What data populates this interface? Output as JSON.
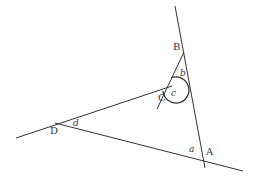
{
  "diagram": {
    "type": "geometry-quadrilateral-angles",
    "points": {
      "A": {
        "label": "A",
        "x": 203,
        "y": 158
      },
      "B": {
        "label": "B",
        "x": 182,
        "y": 45
      },
      "C": {
        "label": "C",
        "x": 172,
        "y": 86
      },
      "D": {
        "label": "D",
        "x": 55,
        "y": 123
      }
    },
    "angles": {
      "a": "a",
      "b": "b",
      "c": "c",
      "d": "d"
    },
    "colors": {
      "stroke": "#333333",
      "background": "#ffffff"
    }
  }
}
